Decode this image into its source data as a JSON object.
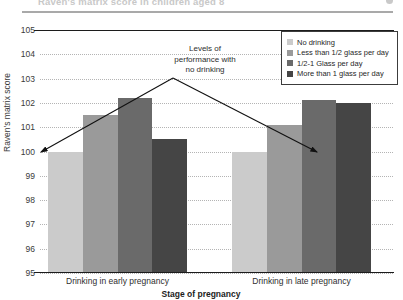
{
  "header": {
    "title": "Raven's matrix score in children aged 8",
    "mark": "logo-dot"
  },
  "chart_data": {
    "type": "bar",
    "title": "",
    "xlabel": "Stage of pregnancy",
    "ylabel": "Raven's matrix score",
    "categories": [
      "Drinking in early pregnancy",
      "Drinking in late pregnancy"
    ],
    "series": [
      {
        "name": "No drinking",
        "color": "#cbcbcb",
        "values": [
          100.0,
          100.0
        ]
      },
      {
        "name": "Less than 1/2 glass per day",
        "color": "#9a9a9a",
        "values": [
          101.5,
          101.1
        ]
      },
      {
        "name": "1/2-1 Glass per day",
        "color": "#6a6a6a",
        "values": [
          102.2,
          102.1
        ]
      },
      {
        "name": "More than 1 glass per day",
        "color": "#454545",
        "values": [
          100.5,
          102.0
        ]
      }
    ],
    "ylim": [
      95,
      105
    ],
    "yticks": [
      95,
      96,
      97,
      98,
      99,
      100,
      101,
      102,
      103,
      104,
      105
    ],
    "grid": true,
    "legend_position": "top-right",
    "reference_line": {
      "value": 100,
      "label": "no drinking baseline"
    },
    "annotation": {
      "line1": "Levels of",
      "line2": "performance with",
      "line3": "no drinking"
    }
  }
}
